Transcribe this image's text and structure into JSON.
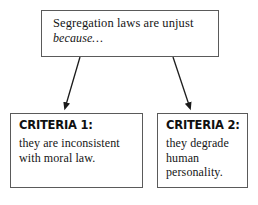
{
  "diagram": {
    "title_text": "Segregation laws are unjust because...",
    "type": "flowchart",
    "colors": {
      "box_border": "#5a5a5a",
      "box_fill": "#ffffff",
      "text": "#151515",
      "arrow": "#1a1a1a",
      "page_background": "#ffffff"
    },
    "premise": {
      "line1": "Segregation laws are unjust",
      "line2": "because…"
    },
    "criteria": [
      {
        "heading": "CRITERIA 1:",
        "body_lines": [
          "they are inconsistent",
          "with moral law."
        ]
      },
      {
        "heading": "CRITERIA 2:",
        "body_lines": [
          "they degrade",
          "human",
          "personality."
        ]
      }
    ],
    "connectors": [
      {
        "name": "arrow-to-criteria-1",
        "from": [
          80,
          57
        ],
        "to": [
          64,
          110
        ]
      },
      {
        "name": "arrow-to-criteria-2",
        "from": [
          173,
          57
        ],
        "to": [
          191,
          110
        ]
      }
    ]
  }
}
